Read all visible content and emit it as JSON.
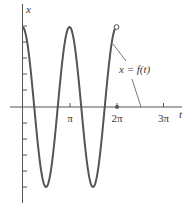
{
  "figure": {
    "y_axis_label": "x",
    "x_axis_label": "t",
    "curve_label": "x = f(t)",
    "ticks": [
      {
        "label": "π",
        "t": 3.14159
      },
      {
        "label": "2π",
        "t": 6.28319
      },
      {
        "label": "3π",
        "t": 9.42478
      }
    ],
    "colors": {
      "curve": "#555555",
      "axis": "#555555",
      "text": "#3a3a3a"
    }
  },
  "chart_data": {
    "type": "line",
    "title": "",
    "xlabel": "t",
    "ylabel": "x",
    "function": "x = 5 cos(2t)",
    "curve_label": "x = f(t)",
    "t_range": [
      0,
      6.2832
    ],
    "y_range": [
      -5,
      5
    ],
    "x_ticks": [
      "π",
      "2π",
      "3π"
    ],
    "y_ticks_count_above": 5,
    "y_ticks_count_below": 5,
    "endpoints": {
      "start": {
        "t": 0,
        "x": 5,
        "marker": "none"
      },
      "end": {
        "t": 6.2832,
        "x": 5,
        "marker": "open-circle"
      }
    },
    "axis_point": {
      "t": 6.2832,
      "x": 0,
      "marker": "filled-dot"
    },
    "series": [
      {
        "name": "x = f(t)",
        "x": [
          0,
          0.785,
          1.571,
          2.356,
          3.142,
          3.927,
          4.712,
          5.498,
          6.283
        ],
        "values": [
          5,
          0,
          -5,
          0,
          5,
          0,
          -5,
          0,
          5
        ]
      }
    ],
    "grid": false
  }
}
